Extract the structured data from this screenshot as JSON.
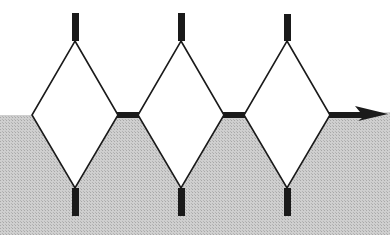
{
  "diagram": {
    "colors": {
      "background": "#ffffff",
      "ground": "#c8c8c8",
      "stroke": "#1a1a1a"
    },
    "diamonds": [
      {
        "cx": 75,
        "left": 32,
        "right": 118
      },
      {
        "cx": 181,
        "left": 138,
        "right": 224
      },
      {
        "cx": 287,
        "left": 244,
        "right": 330
      }
    ],
    "surface_y": 115,
    "top_y": 41,
    "bottom_y": 188,
    "arrow": {
      "from_x": 330,
      "to_x": 386,
      "y": 115,
      "direction": "right"
    }
  }
}
